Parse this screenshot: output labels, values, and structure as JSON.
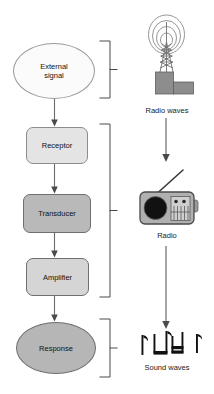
{
  "diagram": {
    "flow": {
      "nodes": [
        {
          "id": "external-signal",
          "label_line1": "External",
          "label_line2": "signal",
          "shape": "ellipse",
          "fill": "#fbfbfb"
        },
        {
          "id": "receptor",
          "label": "Receptor",
          "shape": "rounded-rect",
          "fill": "#e4e4e4"
        },
        {
          "id": "transducer",
          "label": "Transducer",
          "shape": "rounded-rect",
          "fill": "#b9b9b9"
        },
        {
          "id": "amplifier",
          "label": "Amplifier",
          "shape": "rounded-rect",
          "fill": "#d5d5d5"
        },
        {
          "id": "response",
          "label": "Response",
          "shape": "ellipse",
          "fill": "#b6b6b6"
        }
      ],
      "arrows": [
        "external-signal->receptor",
        "receptor->transducer",
        "transducer->amplifier",
        "amplifier->response"
      ]
    },
    "brackets": [
      {
        "id": "bracket-top",
        "groups": [
          "external-signal"
        ]
      },
      {
        "id": "bracket-middle",
        "groups": [
          "receptor",
          "transducer",
          "amplifier"
        ]
      },
      {
        "id": "bracket-bottom",
        "groups": [
          "response"
        ]
      }
    ],
    "analogy": {
      "items": [
        {
          "id": "radio-waves",
          "caption": "Radio waves",
          "icon": "radio-tower-icon"
        },
        {
          "id": "radio",
          "caption": "Radio",
          "icon": "radio-receiver-icon"
        },
        {
          "id": "sound-waves",
          "caption": "Sound waves",
          "icon": "music-notes-icon"
        }
      ],
      "arrows": [
        "radio-waves->radio",
        "radio->sound-waves"
      ]
    },
    "colors": {
      "stroke": "#6e6e6e",
      "text": "#111111",
      "arrow": "#555555",
      "bracket": "#4a4a4a",
      "tower_fill": "#8d8d8d",
      "radio_body": "#b0b0b0",
      "radio_speaker": "#111111",
      "note_fill": "#111111"
    }
  }
}
